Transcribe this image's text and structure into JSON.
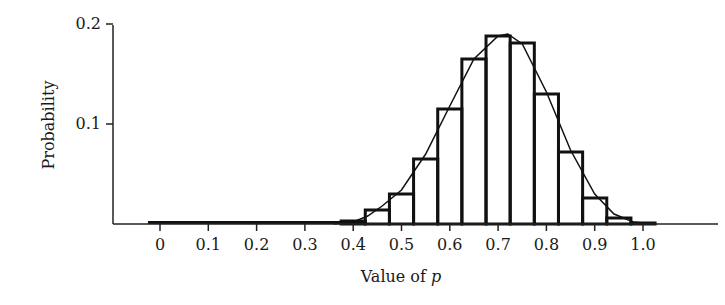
{
  "chart_data": {
    "type": "bar",
    "title": "",
    "xlabel": "Value of p",
    "xlabel_prefix": "Value of ",
    "xlabel_var": "p",
    "ylabel": "Probability",
    "xlim": [
      -0.05,
      1.1
    ],
    "ylim": [
      0,
      0.2
    ],
    "grid": false,
    "legend": null,
    "x_ticks": [
      "0",
      "0.1",
      "0.2",
      "0.3",
      "0.4",
      "0.5",
      "0.6",
      "0.7",
      "0.8",
      "0.9",
      "1.0"
    ],
    "y_ticks": [
      "0.1",
      "0.2"
    ],
    "bin_width": 0.05,
    "categories": [
      0.0,
      0.05,
      0.1,
      0.15,
      0.2,
      0.25,
      0.3,
      0.35,
      0.4,
      0.45,
      0.5,
      0.55,
      0.6,
      0.65,
      0.7,
      0.75,
      0.8,
      0.85,
      0.9,
      0.95,
      1.0
    ],
    "series": [
      {
        "name": "Histogram",
        "type": "bar",
        "values": [
          0.0,
          0.0,
          0.0,
          0.0,
          0.0,
          0.0,
          0.0,
          0.0,
          0.003,
          0.014,
          0.03,
          0.065,
          0.115,
          0.165,
          0.188,
          0.181,
          0.13,
          0.072,
          0.026,
          0.006,
          0.001
        ]
      },
      {
        "name": "Density curve",
        "type": "line",
        "x": [
          0.36,
          0.4,
          0.43,
          0.46,
          0.5,
          0.55,
          0.6,
          0.65,
          0.7,
          0.72,
          0.75,
          0.8,
          0.85,
          0.9,
          0.94,
          0.98,
          1.02
        ],
        "values": [
          0.0,
          0.002,
          0.008,
          0.018,
          0.034,
          0.07,
          0.118,
          0.165,
          0.188,
          0.19,
          0.18,
          0.132,
          0.074,
          0.03,
          0.01,
          0.002,
          0.0
        ]
      }
    ]
  }
}
